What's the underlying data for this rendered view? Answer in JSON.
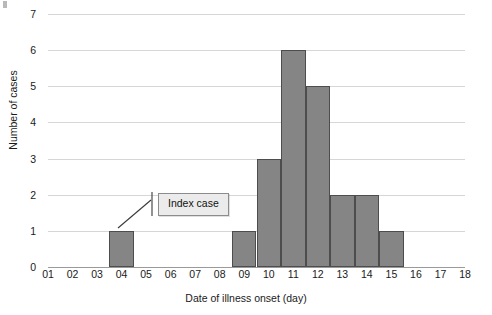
{
  "chart_data": {
    "type": "bar",
    "title": "",
    "xlabel": "Date of illness onset (day)",
    "ylabel": "Number of cases",
    "categories": [
      "01",
      "02",
      "03",
      "04",
      "05",
      "06",
      "07",
      "08",
      "09",
      "10",
      "11",
      "12",
      "13",
      "14",
      "15",
      "16",
      "17",
      "18"
    ],
    "values": [
      0,
      0,
      0,
      1,
      0,
      0,
      0,
      0,
      1,
      3,
      6,
      5,
      2,
      2,
      1,
      0,
      0,
      0
    ],
    "ylim": [
      0,
      7
    ],
    "yticks": [
      "0",
      "1",
      "2",
      "3",
      "4",
      "5",
      "6",
      "7"
    ],
    "xlim": [
      "01",
      "18"
    ],
    "grid": "horizontal",
    "legend": "none",
    "annotations": [
      {
        "text": "Index case",
        "points_to_category": "04",
        "points_to_value": 1
      }
    ],
    "bar_color": "#858585",
    "bar_border_color": "#4d4d4d",
    "grid_color": "#d6d6d6",
    "axis_color": "#9a9a9a"
  }
}
